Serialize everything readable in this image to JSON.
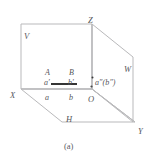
{
  "figure": {
    "caption": "(a)",
    "line_color": "#b9b9bb",
    "emphasis_color": "#2b2b2b",
    "label_color": "#55565a",
    "planes": [
      {
        "id": "V",
        "label": "V",
        "name": "frontal-projection-plane",
        "x": 24,
        "y": 32
      },
      {
        "id": "H",
        "label": "H",
        "name": "horizontal-projection-plane",
        "x": 66,
        "y": 115
      },
      {
        "id": "W",
        "label": "W",
        "name": "profile-projection-plane",
        "x": 124,
        "y": 65
      }
    ],
    "axes": [
      {
        "id": "X",
        "label": "X",
        "name": "x-axis",
        "x": 10,
        "y": 91
      },
      {
        "id": "Y",
        "label": "Y",
        "name": "y-axis",
        "x": 138,
        "y": 127
      },
      {
        "id": "Z",
        "label": "Z",
        "name": "z-axis",
        "x": 88,
        "y": 16
      },
      {
        "id": "O",
        "label": "O",
        "name": "origin",
        "x": 88,
        "y": 95
      }
    ],
    "points": [
      {
        "id": "A",
        "label": "A",
        "name": "point-a",
        "x": 45,
        "y": 69
      },
      {
        "id": "B",
        "label": "B",
        "name": "point-b",
        "x": 69,
        "y": 69
      },
      {
        "id": "a1",
        "label": "a′",
        "name": "point-a-prime",
        "x": 44,
        "y": 79
      },
      {
        "id": "b1",
        "label": "b′",
        "name": "point-b-prime",
        "x": 68,
        "y": 79
      },
      {
        "id": "a",
        "label": "a",
        "name": "point-a-horizontal",
        "x": 45,
        "y": 94
      },
      {
        "id": "b",
        "label": "b",
        "name": "point-b-horizontal",
        "x": 69,
        "y": 94
      },
      {
        "id": "ab2",
        "label": "a″(b″)",
        "name": "point-a-double-prime-b-double-prime",
        "x": 95,
        "y": 79
      }
    ],
    "segment": {
      "name": "segment-ab-horizontal-projection",
      "x1": 51,
      "y1": 84,
      "x2": 77,
      "y2": 84
    },
    "geometry": {
      "v_plane_path": "M21,24 L92,24 L92,89 L21,89 Z",
      "w_plane_path": "M92,24 L133,57 L133,122 L92,89 Z",
      "h_plane_path": "M21,89 L62,122 L135,122 L92,89 Z",
      "z_axis": {
        "x1": 92,
        "y1": 24,
        "x2": 92,
        "y2": 89
      },
      "x_axis": {
        "x1": 21,
        "y1": 89,
        "x2": 92,
        "y2": 89
      },
      "y_axis": {
        "x1": 92,
        "y1": 89,
        "x2": 135,
        "y2": 122
      },
      "origin_dot": {
        "cx": 91.5,
        "cy": 86.5,
        "r": 1.1
      },
      "ab2_dot": {
        "cx": 92.5,
        "cy": 77.5,
        "r": 1.0
      }
    }
  }
}
